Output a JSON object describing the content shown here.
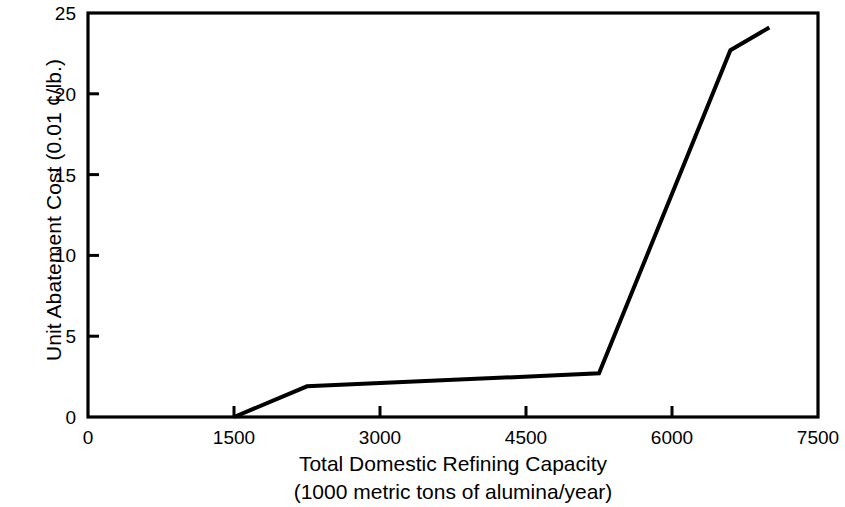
{
  "chart_data": {
    "type": "line",
    "title": "",
    "xlabel": "Total Domestic Refining Capacity",
    "xlabel_line2": "(1000 metric tons of alumina/year)",
    "ylabel": "Unit Abatement Cost (0.01 ¢/lb.)",
    "xlim": [
      0,
      7500
    ],
    "ylim": [
      0,
      25
    ],
    "xticks": [
      0,
      1500,
      3000,
      4500,
      6000,
      7500
    ],
    "xtick_labels": [
      "0",
      "1500",
      "3000",
      "4500",
      "6000",
      "7500"
    ],
    "yticks": [
      0,
      5,
      10,
      15,
      20,
      25
    ],
    "ytick_labels": [
      "0",
      "5",
      "10",
      "15",
      "20",
      "25"
    ],
    "grid": false,
    "legend": null,
    "series": [
      {
        "name": "Unit Abatement Cost",
        "color": "#000000",
        "line_width": 4,
        "x": [
          1500,
          2250,
          5250,
          6600,
          7000
        ],
        "y": [
          0,
          1.9,
          2.7,
          22.7,
          24.1
        ],
        "points": [
          {
            "x": 1500,
            "y": 0
          },
          {
            "x": 2250,
            "y": 1.9
          },
          {
            "x": 5250,
            "y": 2.7
          },
          {
            "x": 6600,
            "y": 22.7
          },
          {
            "x": 7000,
            "y": 24.1
          }
        ]
      }
    ],
    "axis_color": "#000000",
    "background": "#ffffff"
  }
}
